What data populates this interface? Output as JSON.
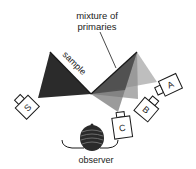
{
  "diagram": {
    "title_line1": "mixture of",
    "title_line2": "primaries",
    "sample_label": "sample",
    "observer_label": "observer",
    "sources": [
      {
        "id": "S",
        "label": "S"
      },
      {
        "id": "A",
        "label": "A"
      },
      {
        "id": "B",
        "label": "B"
      },
      {
        "id": "C",
        "label": "C"
      }
    ]
  },
  "colors": {
    "dark_cone": "#2b2b2b",
    "mid_cone": "#707070",
    "light_cone": "#a8a8a8",
    "stroke": "#1a1a1a"
  }
}
